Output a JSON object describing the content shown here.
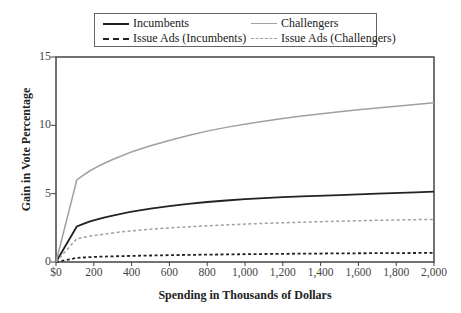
{
  "chart_data": {
    "type": "line",
    "title": "",
    "xlabel": "Spending in Thousands of Dollars",
    "ylabel": "Gain in Vote Percentage",
    "xlim": [
      0,
      2000
    ],
    "ylim": [
      0,
      15
    ],
    "grid": false,
    "legend_position": "top, boxed, above plot",
    "x_tick_labels": [
      "$0",
      "200",
      "400",
      "600",
      "800",
      "1,000",
      "1,200",
      "1,400",
      "1,600",
      "1,800",
      "2,000"
    ],
    "x_ticks": [
      0,
      200,
      400,
      600,
      800,
      1000,
      1200,
      1400,
      1600,
      1800,
      2000
    ],
    "y_tick_labels": [
      "0",
      "5",
      "10",
      "15"
    ],
    "y_ticks": [
      0,
      5,
      10,
      15
    ],
    "x": [
      0,
      110,
      200,
      400,
      600,
      800,
      1000,
      1200,
      1400,
      1600,
      1800,
      2000
    ],
    "series": [
      {
        "name": "Incumbents",
        "style": "solid",
        "color": "#222222",
        "values": [
          0,
          2.6,
          3.1,
          3.7,
          4.1,
          4.4,
          4.6,
          4.75,
          4.85,
          4.95,
          5.05,
          5.15
        ]
      },
      {
        "name": "Challengers",
        "style": "solid",
        "color": "#a0a0a0",
        "values": [
          0,
          6.0,
          6.9,
          8.1,
          8.9,
          9.6,
          10.1,
          10.5,
          10.85,
          11.15,
          11.4,
          11.65
        ]
      },
      {
        "name": "Issue Ads (Incumbents)",
        "style": "dashed",
        "color": "#222222",
        "values": [
          0,
          0.3,
          0.38,
          0.45,
          0.5,
          0.54,
          0.57,
          0.6,
          0.62,
          0.64,
          0.65,
          0.67
        ]
      },
      {
        "name": "Issue Ads (Challengers)",
        "style": "dashed",
        "color": "#a0a0a0",
        "values": [
          0,
          1.7,
          1.95,
          2.3,
          2.5,
          2.65,
          2.78,
          2.87,
          2.95,
          3.02,
          3.08,
          3.12
        ]
      }
    ]
  }
}
